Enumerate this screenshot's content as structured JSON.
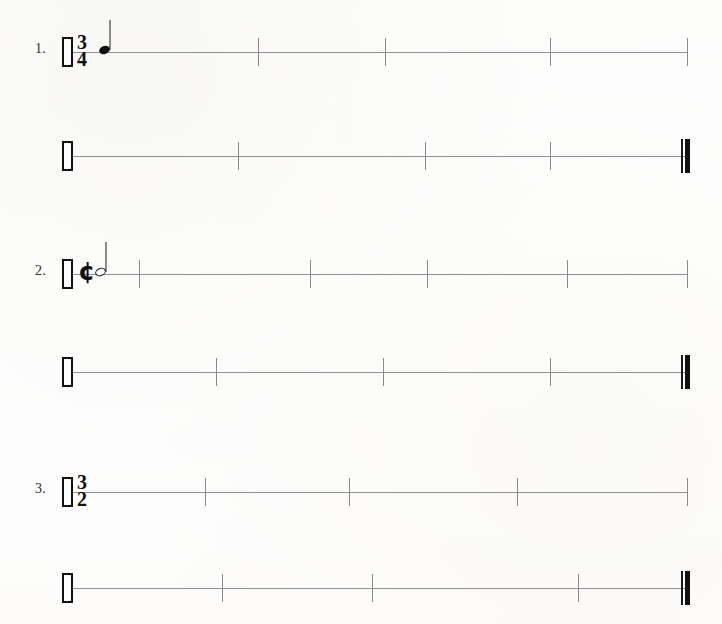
{
  "page": {
    "background_color": "#fefefe",
    "width": 722,
    "height": 624
  },
  "glyphs": {
    "cut_time": "¢",
    "common_time": "C"
  },
  "exercises": [
    {
      "number_label": "1.",
      "time_signature": {
        "type": "numeric",
        "numerator": "3",
        "denominator": "4"
      },
      "systems": [
        {
          "name": "exercise-1-system-1",
          "top": 24,
          "left": 62,
          "right": 688,
          "start_barline": "open-rect",
          "end_barline": "tick",
          "ticks": [
            258,
            385,
            550
          ],
          "notes": [
            {
              "type": "quarter",
              "head": "filled",
              "stem": "up",
              "x": 97
            }
          ]
        },
        {
          "name": "exercise-1-system-2",
          "top": 128,
          "left": 62,
          "right": 690,
          "start_barline": "open-rect",
          "end_barline": "final",
          "ticks": [
            238,
            425,
            550
          ],
          "notes": []
        }
      ]
    },
    {
      "number_label": "2.",
      "time_signature": {
        "type": "symbol",
        "symbol": "cut_time",
        "label": "¢"
      },
      "systems": [
        {
          "name": "exercise-2-system-1",
          "top": 246,
          "left": 62,
          "right": 688,
          "start_barline": "open-rect",
          "end_barline": "tick",
          "ticks": [
            139,
            310,
            427,
            567
          ],
          "notes": [
            {
              "type": "half",
              "head": "open",
              "stem": "up",
              "x": 93
            }
          ]
        },
        {
          "name": "exercise-2-system-2",
          "top": 344,
          "left": 62,
          "right": 690,
          "start_barline": "open-rect",
          "end_barline": "final",
          "ticks": [
            216,
            383,
            550
          ],
          "notes": []
        }
      ]
    },
    {
      "number_label": "3.",
      "time_signature": {
        "type": "numeric",
        "numerator": "3",
        "denominator": "2"
      },
      "systems": [
        {
          "name": "exercise-3-system-1",
          "top": 464,
          "left": 62,
          "right": 688,
          "start_barline": "open-rect",
          "end_barline": "tick",
          "ticks": [
            205,
            349,
            517
          ],
          "notes": []
        },
        {
          "name": "exercise-3-system-2",
          "top": 560,
          "left": 62,
          "right": 690,
          "start_barline": "open-rect",
          "end_barline": "final",
          "ticks": [
            222,
            372,
            578
          ],
          "notes": []
        }
      ]
    }
  ]
}
